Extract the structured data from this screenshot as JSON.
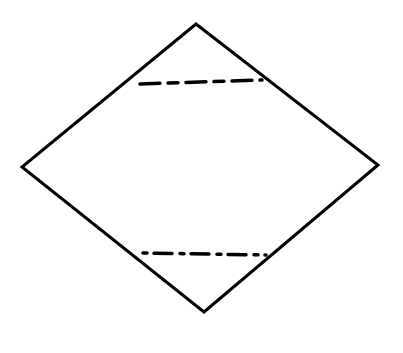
{
  "diagram": {
    "canvas": {
      "width": 403,
      "height": 353,
      "background": "#ffffff"
    },
    "stroke_color": "#000000",
    "shape": {
      "type": "rhombus",
      "vertices": {
        "top": [
          196,
          24
        ],
        "right": [
          378,
          165
        ],
        "bottom": [
          204,
          312
        ],
        "left": [
          22,
          167
        ]
      },
      "stroke_width": 3
    },
    "dashed_lines": [
      {
        "name": "upper-fold-line",
        "from": [
          140,
          84
        ],
        "to": [
          262,
          80
        ],
        "dasharray": "20 8 10 8",
        "stroke_width": 3.5
      },
      {
        "name": "lower-fold-line",
        "from": [
          143,
          253
        ],
        "to": [
          266,
          255
        ],
        "dasharray": "4 7 18 8",
        "stroke_width": 3.5
      }
    ]
  }
}
